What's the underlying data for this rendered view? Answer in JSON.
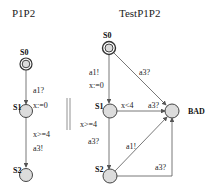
{
  "automata": [
    {
      "title": "P1P2",
      "states": [
        {
          "id": "S0",
          "label": "S0",
          "initial": true
        },
        {
          "id": "S1",
          "label": "S1"
        },
        {
          "id": "S2",
          "label": "S2"
        }
      ],
      "edges": [
        {
          "from": "S0",
          "to": "S1",
          "labels": [
            "a1?",
            "x:=0"
          ]
        },
        {
          "from": "S1",
          "to": "S2",
          "labels": [
            "x>=4",
            "a3!"
          ]
        }
      ]
    },
    {
      "title": "TestP1P2",
      "states": [
        {
          "id": "S0",
          "label": "S0",
          "initial": true
        },
        {
          "id": "S1",
          "label": "S1"
        },
        {
          "id": "S2",
          "label": "S2"
        },
        {
          "id": "BAD",
          "label": "BAD"
        }
      ],
      "edges": [
        {
          "from": "S0",
          "to": "S1",
          "labels": [
            "a1!",
            "x:=0"
          ]
        },
        {
          "from": "S0",
          "to": "BAD",
          "labels": [
            "a3?"
          ]
        },
        {
          "from": "S1",
          "to": "BAD",
          "labels": [
            "x<4",
            "a3?"
          ]
        },
        {
          "from": "S1",
          "to": "S2",
          "labels": [
            "x>=4",
            "a3?"
          ]
        },
        {
          "from": "S2",
          "to": "BAD",
          "labels": [
            "a1!"
          ]
        },
        {
          "from": "S2",
          "to": "BAD",
          "labels": [
            "a3?"
          ]
        }
      ]
    }
  ],
  "separator": "||"
}
